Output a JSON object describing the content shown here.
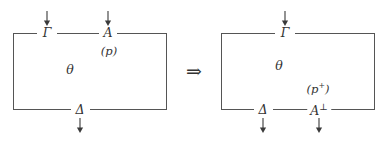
{
  "figure": {
    "kind": "proof-net-rewrite-diagram",
    "implication_symbol": "⇒",
    "arrow_icon_name": "down-arrow-icon",
    "left_net": {
      "name": "left-proof-net",
      "box_label": "θ",
      "top_ports": [
        {
          "label": "Γ",
          "has_arrow": true
        },
        {
          "label": "A",
          "has_arrow": true
        }
      ],
      "bottom_ports": [
        {
          "label": "Δ",
          "has_arrow": true
        }
      ],
      "annotation": "(p)"
    },
    "right_net": {
      "name": "right-proof-net",
      "box_label": "θ",
      "top_ports": [
        {
          "label": "Γ",
          "has_arrow": true
        }
      ],
      "bottom_ports": [
        {
          "label": "Δ",
          "has_arrow": true
        },
        {
          "label": "A",
          "superscript": "⊥",
          "has_arrow": true
        }
      ],
      "annotation_base": "(p",
      "annotation_sup": "+",
      "annotation_close": ")"
    }
  }
}
